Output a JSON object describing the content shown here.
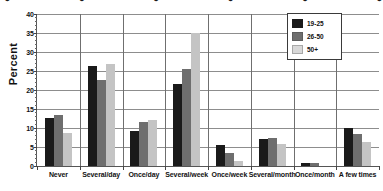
{
  "figure": {
    "title_partial": "cropped title text (illegible, cut off at top edge)"
  },
  "axis": {
    "ylabel": "Percent",
    "yticks": [
      "0",
      "5",
      "10",
      "15",
      "20",
      "25",
      "30",
      "35",
      "40"
    ]
  },
  "legend": {
    "items": [
      {
        "label": "19-25",
        "color": "#1a1a1a"
      },
      {
        "label": "26-50",
        "color": "#6e6e6e"
      },
      {
        "label": "50+",
        "color": "#d8d8d8"
      }
    ]
  },
  "chart_data": {
    "type": "bar",
    "title": "",
    "xlabel": "",
    "ylabel": "Percent",
    "ylim": [
      0,
      40
    ],
    "yticks": [
      0,
      5,
      10,
      15,
      20,
      25,
      30,
      35,
      40
    ],
    "grid": "horizontal-and-vertical",
    "legend_position": "top-right",
    "categories": [
      "Never",
      "Several/day",
      "Once/day",
      "Several/week",
      "Once/week",
      "Several/month",
      "Once/month",
      "A few times"
    ],
    "series": [
      {
        "name": "19-25",
        "color": "#1a1a1a",
        "values": [
          12.6,
          26.3,
          9.2,
          21.7,
          5.4,
          7.0,
          0.8,
          10.0
        ]
      },
      {
        "name": "26-50",
        "color": "#6e6e6e",
        "values": [
          13.5,
          22.7,
          11.7,
          25.6,
          3.3,
          7.4,
          0.9,
          8.4
        ]
      },
      {
        "name": "50+",
        "color": "#d8d8d8",
        "values": [
          8.6,
          26.8,
          12.1,
          35.0,
          1.3,
          5.7,
          0.0,
          6.2
        ]
      }
    ]
  }
}
